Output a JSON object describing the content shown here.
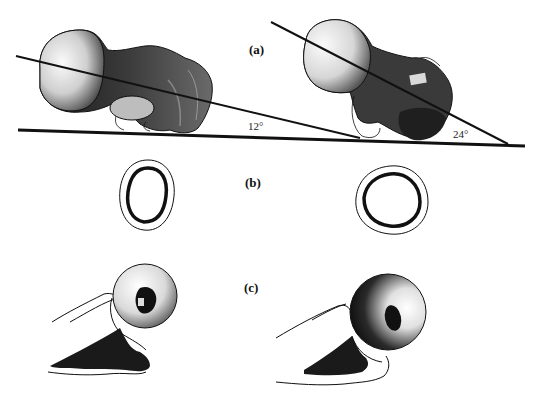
{
  "figure": {
    "panels": [
      {
        "id": "a",
        "label": "(a)",
        "description": "Femur lateral view with neck axis lines against baseline"
      },
      {
        "id": "b",
        "label": "(b)",
        "description": "Cross-sections of femoral neck"
      },
      {
        "id": "c",
        "label": "(c)",
        "description": "Femoral head end-on view"
      }
    ],
    "angles": {
      "left": "12°",
      "right": "24°"
    },
    "colors": {
      "ink": "#111111",
      "background": "#ffffff"
    }
  }
}
